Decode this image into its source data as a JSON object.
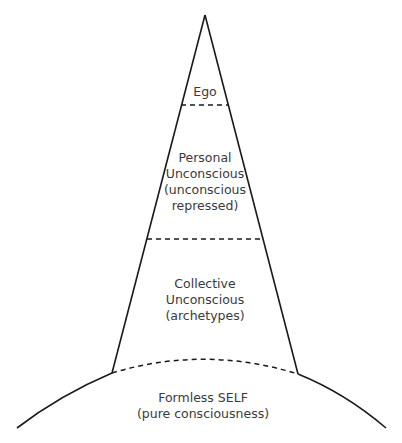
{
  "diagram": {
    "layers": [
      {
        "id": "ego",
        "lines": [
          "Ego"
        ]
      },
      {
        "id": "personal-unconscious",
        "lines": [
          "Personal",
          "Unconscious",
          "(unconscious",
          "repressed)"
        ]
      },
      {
        "id": "collective-unconscious",
        "lines": [
          "Collective",
          "Unconscious",
          "(archetypes)"
        ]
      },
      {
        "id": "formless-self",
        "lines": [
          "Formless SELF",
          "(pure consciousness)"
        ]
      }
    ],
    "colors": {
      "stroke": "#1a1a1a",
      "text": "#3a3a3a",
      "background": "#ffffff"
    }
  }
}
